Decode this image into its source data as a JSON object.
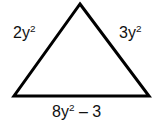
{
  "figure": {
    "name": "triangle-with-algebraic-side-labels",
    "shape": "triangle",
    "background_color": "#ffffff",
    "stroke_color": "#000000",
    "stroke_width": 3,
    "vertices": {
      "apex": [
        80,
        4
      ],
      "bottom_left": [
        14,
        96
      ],
      "bottom_right": [
        149,
        96
      ]
    },
    "labels": {
      "left_side": {
        "coefficient": "2",
        "variable": "y",
        "exponent": "2",
        "text": "2y²"
      },
      "right_side": {
        "coefficient": "3",
        "variable": "y",
        "exponent": "2",
        "text": "3y²"
      },
      "bottom_side": {
        "coefficient": "8",
        "variable": "y",
        "exponent": "2",
        "operator": "–",
        "constant": "3",
        "text": "8y² – 3"
      }
    }
  }
}
